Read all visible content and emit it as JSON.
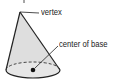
{
  "diagram": {
    "shape": "cone",
    "labels": {
      "vertex": "vertex",
      "center_of_base": "center of base"
    },
    "colors": {
      "fill": "#dcdcdc",
      "stroke": "#222222"
    }
  }
}
